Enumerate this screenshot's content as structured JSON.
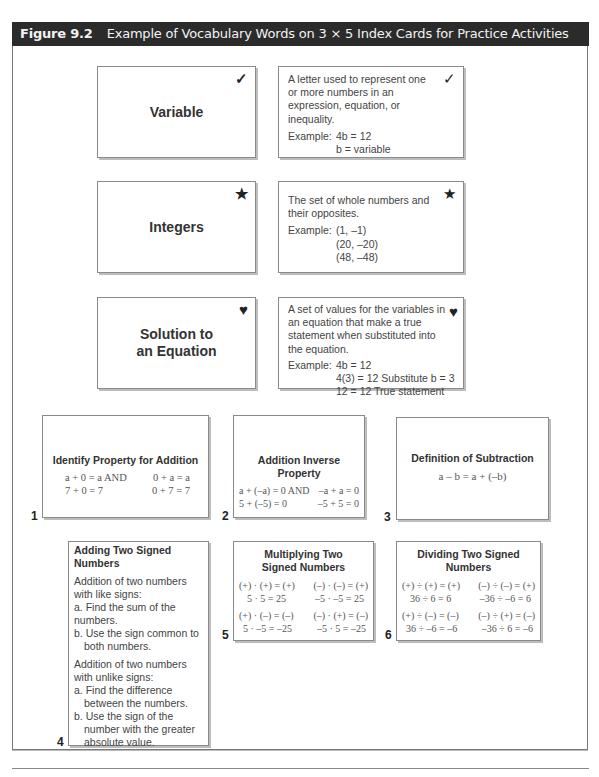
{
  "header": {
    "figure_label": "Figure 9.2",
    "title": "Example of Vocabulary Words on 3 × 5 Index Cards for Practice Activities"
  },
  "vocab_cards": [
    {
      "term": "Variable",
      "icon": "check-mark-icon",
      "glyph": "✓",
      "definition": "A letter used to represent one or more numbers in an expression, equation, or inequality.",
      "example_label": "Example:",
      "example_lines": [
        "4b = 12",
        "b = variable"
      ]
    },
    {
      "term": "Integers",
      "icon": "star-icon",
      "glyph": "★",
      "definition": "The set of whole numbers and their opposites.",
      "example_label": "Example:",
      "example_lines": [
        "(1, –1)",
        "(20, –20)",
        "(48, –48)"
      ]
    },
    {
      "term_line1": "Solution to",
      "term_line2": "an Equation",
      "icon": "heart-icon",
      "glyph": "♥",
      "definition": "A set of values for the variables in an equation that make a true statement when substituted into the equation.",
      "example_label": "Example:",
      "example_lines": [
        "4b = 12",
        "4(3) = 12 Substitute b = 3",
        "12 = 12 True statement"
      ]
    }
  ],
  "property_cards": [
    {
      "number": "1",
      "title": "Identify Property for Addition",
      "rows": [
        [
          "a + 0 = a  AND",
          "0 + a = a"
        ],
        [
          "7 + 0 = 7",
          "0 + 7 = 7"
        ]
      ]
    },
    {
      "number": "2",
      "title": "Addition Inverse Property",
      "rows": [
        [
          "a + (–a) = 0  AND",
          "–a + a = 0"
        ],
        [
          "5 + (–5) = 0",
          "–5 + 5 = 0"
        ]
      ]
    },
    {
      "number": "3",
      "title": "Definition of Subtraction",
      "formula": "a – b = a + (–b)"
    },
    {
      "number": "4",
      "title": "Adding Two Signed Numbers",
      "like_intro": "Addition of two numbers with like signs:",
      "like_steps": [
        "a. Find the sum of the numbers.",
        "b. Use the sign common to both numbers."
      ],
      "unlike_intro": "Addition of two numbers with unlike signs:",
      "unlike_steps": [
        "a. Find the difference between the numbers.",
        "b. Use the sign of the number with the greater absolute value."
      ]
    },
    {
      "number": "5",
      "title": "Multiplying Two Signed Numbers",
      "rows": [
        [
          "(+) · (+) = (+)",
          "(–) · (–) = (+)"
        ],
        [
          "5 · 5 = 25",
          "–5 · –5 = 25"
        ],
        [
          "(+) · (–) = (–)",
          "(–) · (+) = (–)"
        ],
        [
          "5 · –5 = –25",
          "–5 · 5 = –25"
        ]
      ]
    },
    {
      "number": "6",
      "title": "Dividing Two Signed Numbers",
      "rows": [
        [
          "(+) ÷ (+) = (+)",
          "(–) ÷ (–) = (+)"
        ],
        [
          "36 ÷ 6 = 6",
          "–36 ÷ –6 = 6"
        ],
        [
          "(+) ÷ (–) = (–)",
          "(–) ÷ (+) = (–)"
        ],
        [
          "36 ÷ –6 = –6",
          "–36 ÷ 6 = –6"
        ]
      ]
    }
  ]
}
